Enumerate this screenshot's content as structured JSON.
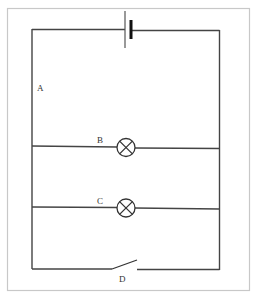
{
  "diagram": {
    "type": "circuit",
    "labels": {
      "a": "A",
      "b": "B",
      "c": "C",
      "d": "D"
    },
    "components": [
      {
        "id": "battery",
        "kind": "cell"
      },
      {
        "id": "B",
        "kind": "lamp"
      },
      {
        "id": "C",
        "kind": "lamp"
      },
      {
        "id": "D",
        "kind": "switch",
        "state": "open"
      }
    ],
    "colors": {
      "wire": "#444444",
      "frame": "#c8c8c8"
    }
  }
}
